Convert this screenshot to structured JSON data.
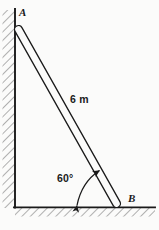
{
  "figure": {
    "labels": {
      "top_point": "A",
      "bottom_point": "B",
      "length": "6 m",
      "angle": "60°"
    },
    "colors": {
      "background": "#fbfbfa",
      "stroke": "#1a1a1a",
      "hatch": "#6b6b6b"
    },
    "geometry": {
      "wall": {
        "x": 15,
        "y_top": 10,
        "y_bottom": 207
      },
      "ground": {
        "y": 207,
        "x_left": 15,
        "x_right": 155
      },
      "ladder": {
        "x1": 17,
        "y1": 28,
        "x2": 118,
        "y2": 205,
        "thickness": 7
      },
      "angle_arc": {
        "vertex_x": 15,
        "vertex_y": 207,
        "value_deg": 60
      }
    }
  }
}
